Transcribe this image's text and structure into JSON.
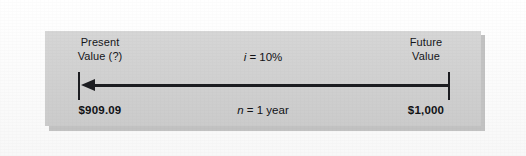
{
  "figure": {
    "type": "timeline-diagram",
    "direction": "right-to-left",
    "panel_color": "#d2d2d2",
    "line_color": "#1c1d21",
    "left_node": {
      "heading_line1": "Present",
      "heading_line2": "Value (?)",
      "amount": "$909.09"
    },
    "right_node": {
      "heading_line1": "Future",
      "heading_line2": "Value",
      "amount": "$1,000"
    },
    "center": {
      "rate_var": "i",
      "rate_equals": " = ",
      "rate_value": "10%",
      "period_var": "n",
      "period_equals": " = ",
      "period_value": "1 year"
    },
    "arrow": {
      "name": "discount-arrow",
      "points_to": "present-value"
    }
  }
}
